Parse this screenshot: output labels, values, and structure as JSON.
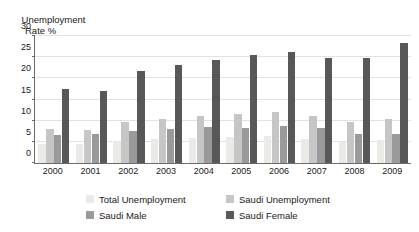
{
  "chart_data": {
    "type": "bar",
    "title": "",
    "ylabel": "Unemployment Rate %",
    "ylabel_line1": "Unemployment",
    "ylabel_line2": "Rate %",
    "xlabel": "",
    "ylim": [
      0,
      30
    ],
    "ytick_step": 5,
    "yticks": [
      0,
      5,
      10,
      15,
      20,
      25,
      30
    ],
    "grid": true,
    "legend_position": "bottom",
    "categories": [
      "2000",
      "2001",
      "2002",
      "2003",
      "2004",
      "2005",
      "2006",
      "2007",
      "2008",
      "2009"
    ],
    "series": [
      {
        "name": "Total Unemployment",
        "color": "#eceae6",
        "values": [
          4.6,
          4.6,
          5.3,
          5.6,
          5.8,
          6.1,
          6.3,
          5.6,
          5.0,
          5.4
        ]
      },
      {
        "name": "Saudi Unemployment",
        "color": "#c6c6c6",
        "values": [
          8.1,
          7.9,
          9.7,
          10.4,
          11.1,
          11.5,
          12.0,
          11.2,
          9.8,
          10.5
        ]
      },
      {
        "name": "Saudi Male",
        "color": "#9a9a9a",
        "values": [
          6.6,
          6.9,
          7.6,
          8.1,
          8.4,
          8.2,
          8.8,
          8.3,
          6.9,
          6.9
        ]
      },
      {
        "name": "Saudi Female",
        "color": "#585858",
        "values": [
          17.5,
          17.1,
          21.7,
          23.2,
          24.4,
          25.4,
          26.3,
          24.7,
          24.9,
          28.4
        ]
      }
    ]
  },
  "legend": {
    "items": [
      {
        "label": "Total Unemployment",
        "swatch": "s0"
      },
      {
        "label": "Saudi Unemployment",
        "swatch": "s1"
      },
      {
        "label": "Saudi Male",
        "swatch": "s2"
      },
      {
        "label": "Saudi Female",
        "swatch": "s3"
      }
    ]
  }
}
